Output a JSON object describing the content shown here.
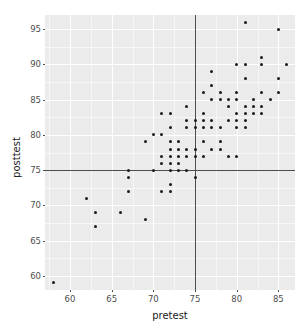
{
  "chart_data": {
    "type": "scatter",
    "title": "",
    "xlabel": "pretest",
    "ylabel": "posttest",
    "xlim": [
      57,
      87
    ],
    "ylim": [
      58,
      97
    ],
    "xticks": [
      60,
      65,
      70,
      75,
      80,
      85
    ],
    "yticks": [
      60,
      65,
      70,
      75,
      80,
      85,
      90,
      95
    ],
    "xtick_labels": [
      "60",
      "65",
      "70",
      "75",
      "80",
      "85"
    ],
    "ytick_labels": [
      "60",
      "65",
      "70",
      "75",
      "80",
      "85",
      "90",
      "95"
    ],
    "x_minor_ticks": [
      57.5,
      62.5,
      67.5,
      72.5,
      77.5,
      82.5
    ],
    "y_minor_ticks": [
      57.5,
      62.5,
      67.5,
      72.5,
      77.5,
      82.5,
      87.5,
      92.5
    ],
    "grid": true,
    "legend": "none",
    "panel_background": "#ebebeb",
    "grid_color": "#ffffff",
    "point_color": "#1a1a1a",
    "reference_lines": [
      {
        "orientation": "vertical",
        "value": 75,
        "color": "#4d4d4d"
      },
      {
        "orientation": "horizontal",
        "value": 75,
        "color": "#4d4d4d"
      }
    ],
    "points": [
      [
        58,
        59
      ],
      [
        62,
        71
      ],
      [
        63,
        69
      ],
      [
        63,
        67
      ],
      [
        66,
        69
      ],
      [
        67,
        75
      ],
      [
        67,
        74
      ],
      [
        67,
        72
      ],
      [
        69,
        68
      ],
      [
        69,
        79
      ],
      [
        70,
        80
      ],
      [
        70,
        75
      ],
      [
        71,
        83
      ],
      [
        71,
        80
      ],
      [
        71,
        77
      ],
      [
        71,
        76
      ],
      [
        71,
        72
      ],
      [
        72,
        83
      ],
      [
        72,
        81
      ],
      [
        72,
        79
      ],
      [
        72,
        78
      ],
      [
        72,
        77
      ],
      [
        72,
        76
      ],
      [
        72,
        75
      ],
      [
        72,
        73
      ],
      [
        72,
        72
      ],
      [
        73,
        79
      ],
      [
        73,
        78
      ],
      [
        73,
        77
      ],
      [
        73,
        76
      ],
      [
        73,
        75
      ],
      [
        74,
        84
      ],
      [
        74,
        82
      ],
      [
        74,
        81
      ],
      [
        74,
        78
      ],
      [
        74,
        77
      ],
      [
        74,
        75
      ],
      [
        75,
        82
      ],
      [
        75,
        81
      ],
      [
        75,
        78
      ],
      [
        75,
        77
      ],
      [
        75,
        74
      ],
      [
        76,
        86
      ],
      [
        76,
        83
      ],
      [
        76,
        82
      ],
      [
        76,
        81
      ],
      [
        76,
        79
      ],
      [
        76,
        77
      ],
      [
        77,
        89
      ],
      [
        77,
        87
      ],
      [
        77,
        85
      ],
      [
        77,
        82
      ],
      [
        77,
        81
      ],
      [
        77,
        78
      ],
      [
        78,
        86
      ],
      [
        78,
        85
      ],
      [
        78,
        81
      ],
      [
        78,
        79
      ],
      [
        78,
        78
      ],
      [
        79,
        85
      ],
      [
        79,
        84
      ],
      [
        79,
        82
      ],
      [
        79,
        77
      ],
      [
        80,
        90
      ],
      [
        80,
        86
      ],
      [
        80,
        85
      ],
      [
        80,
        83
      ],
      [
        80,
        82
      ],
      [
        80,
        81
      ],
      [
        80,
        77
      ],
      [
        81,
        96
      ],
      [
        81,
        90
      ],
      [
        81,
        88
      ],
      [
        81,
        84
      ],
      [
        81,
        83
      ],
      [
        81,
        82
      ],
      [
        81,
        81
      ],
      [
        82,
        85
      ],
      [
        82,
        84
      ],
      [
        82,
        83
      ],
      [
        83,
        91
      ],
      [
        83,
        90
      ],
      [
        83,
        86
      ],
      [
        83,
        84
      ],
      [
        83,
        83
      ],
      [
        84,
        85
      ],
      [
        85,
        95
      ],
      [
        85,
        88
      ],
      [
        85,
        86
      ],
      [
        86,
        90
      ]
    ]
  },
  "axes": {
    "x_title": "pretest",
    "y_title": "posttest"
  }
}
